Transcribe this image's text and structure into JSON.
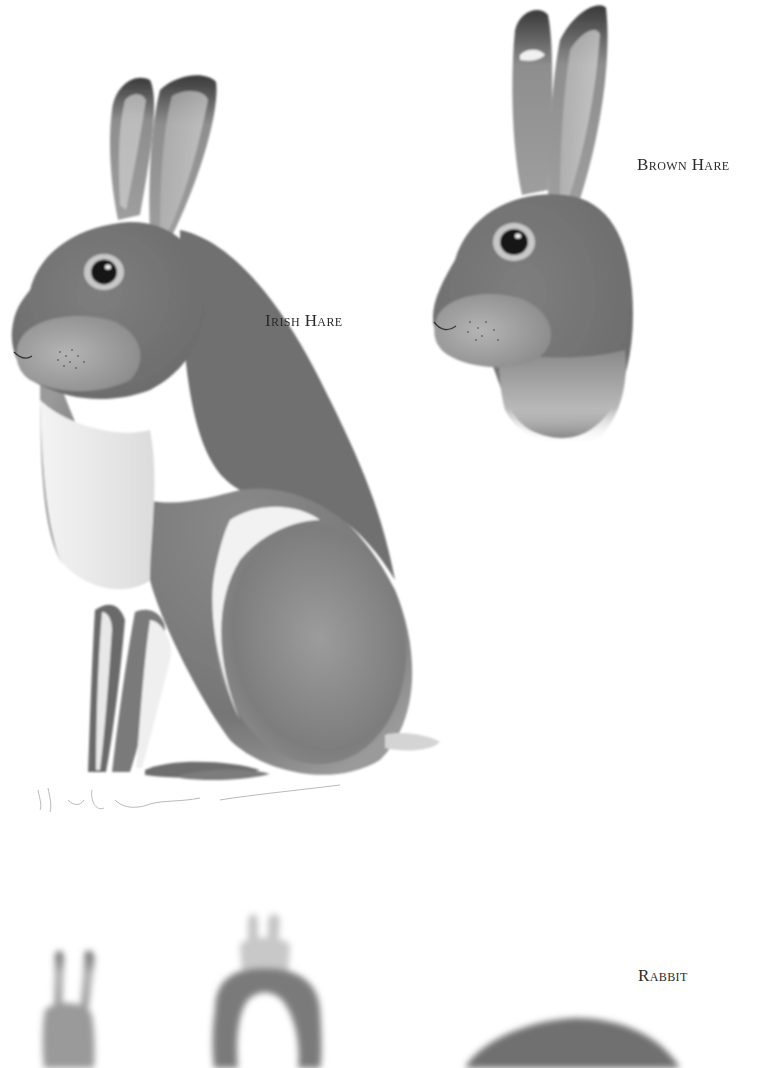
{
  "plate": {
    "background": "#ffffff",
    "ink_color": "#2a2a2a",
    "labels": {
      "brown_hare": "Brown Hare",
      "irish_hare": "Irish Hare",
      "rabbit": "Rabbit"
    },
    "illustrations": [
      {
        "subject": "Irish Hare",
        "view": "full body, seated, facing left",
        "style": "grayscale watercolor"
      },
      {
        "subject": "Brown Hare",
        "view": "head and neck, facing left",
        "style": "grayscale watercolor"
      },
      {
        "subject": "Rabbit",
        "view": "three rabbits partially visible at bottom edge",
        "style": "grayscale watercolor"
      }
    ]
  }
}
